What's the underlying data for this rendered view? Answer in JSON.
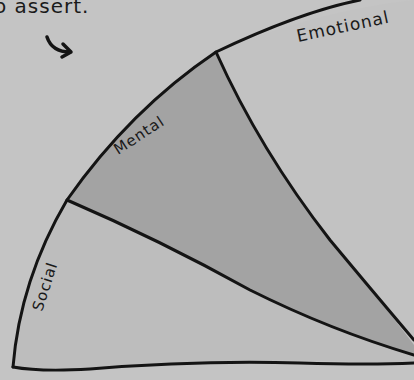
{
  "caption": "o assert.",
  "diagram": {
    "type": "sector-wedge",
    "segments": [
      {
        "label": "Emotional",
        "fill": "#c2c2c2"
      },
      {
        "label": "Mental",
        "fill": "#a3a3a3"
      },
      {
        "label": "Social",
        "fill": "#bdbdbd"
      }
    ],
    "arrow": "curved-arrow-pointing-right",
    "colors": {
      "background": "#c4c4c4",
      "stroke": "#141414"
    }
  }
}
